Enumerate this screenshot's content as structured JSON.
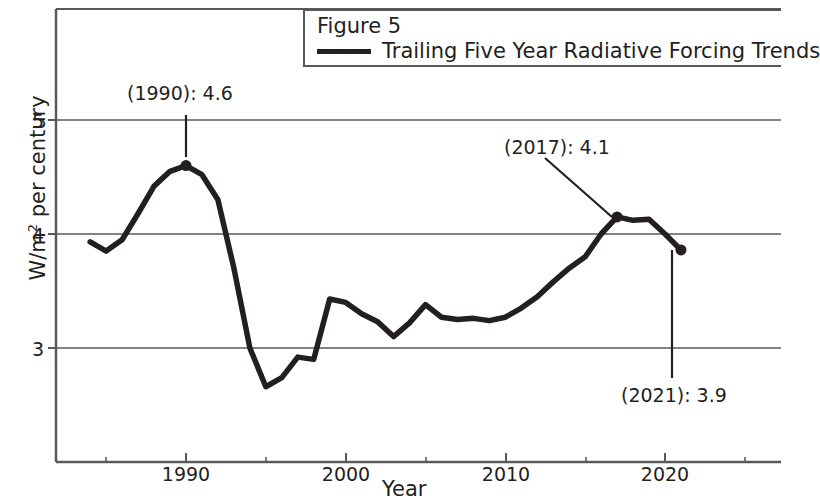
{
  "legend": {
    "title": "Figure 5",
    "entries": [
      {
        "label": "Trailing Five Year Radiative Forcing Trends",
        "color": "#231f20"
      }
    ]
  },
  "axes": {
    "xlabel": "Year",
    "ylabel_main": "W/m",
    "ylabel_sup": "2",
    "ylabel_tail": " per century",
    "ylabel_full": "W/m2 per century",
    "y_ticks": [
      "3",
      "4",
      "5"
    ],
    "x_ticks": [
      "1990",
      "2000",
      "2010",
      "2020"
    ]
  },
  "annotations": [
    {
      "text": "(1990): 4.6",
      "year": 1990,
      "value": 4.6
    },
    {
      "text": "(2017): 4.1",
      "year": 2017,
      "value": 4.1
    },
    {
      "text": "(2021): 3.9",
      "year": 2021,
      "value": 3.9
    }
  ],
  "chart_data": {
    "type": "line",
    "title": "Figure 5",
    "xlabel": "Year",
    "ylabel": "W/m2 per century",
    "xlim": [
      1983,
      2027
    ],
    "ylim": [
      2.5,
      5.35
    ],
    "grid": "horizontal",
    "legend_position": "top-right",
    "x_ticks_major": [
      1990,
      2000,
      2010,
      2020
    ],
    "x_ticks_minor": [
      1985,
      1995,
      2005,
      2015,
      2025
    ],
    "y_ticks": [
      3,
      4,
      5
    ],
    "series": [
      {
        "name": "Trailing Five Year Radiative Forcing Trends",
        "color": "#231f20",
        "x": [
          1984,
          1985,
          1986,
          1987,
          1988,
          1989,
          1990,
          1991,
          1992,
          1993,
          1994,
          1995,
          1996,
          1997,
          1998,
          1999,
          2000,
          2001,
          2002,
          2003,
          2004,
          2005,
          2006,
          2007,
          2008,
          2009,
          2010,
          2011,
          2012,
          2013,
          2014,
          2015,
          2016,
          2017,
          2018,
          2019,
          2020,
          2021
        ],
        "values": [
          3.93,
          3.85,
          3.95,
          4.18,
          4.42,
          4.55,
          4.6,
          4.52,
          4.3,
          3.7,
          3.0,
          2.66,
          2.74,
          2.92,
          2.9,
          3.43,
          3.4,
          3.3,
          3.23,
          3.1,
          3.22,
          3.38,
          3.27,
          3.25,
          3.26,
          3.24,
          3.27,
          3.35,
          3.45,
          3.58,
          3.7,
          3.8,
          4.0,
          4.15,
          4.12,
          4.13,
          4.0,
          3.86
        ]
      }
    ],
    "markers": [
      {
        "year": 1990,
        "value": 4.6
      },
      {
        "year": 2017,
        "value": 4.1
      },
      {
        "year": 2021,
        "value": 3.9
      }
    ]
  }
}
